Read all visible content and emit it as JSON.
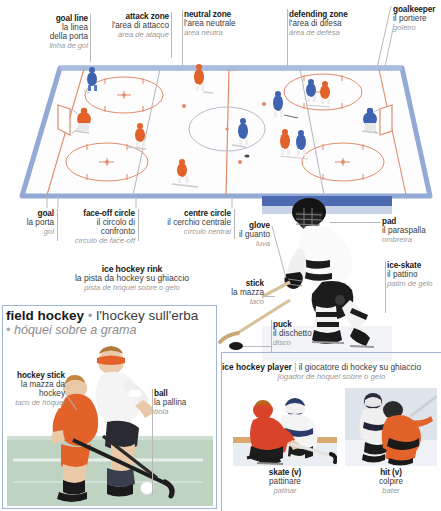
{
  "page": {
    "accent_blue": "#93a9d6",
    "rink_line_color": "#e08a6a",
    "panel_border": "#9fb6d8",
    "label_gray": "#9a9a9a"
  },
  "top_labels": [
    {
      "en": "goal line",
      "it": [
        "la linea",
        "della porta"
      ],
      "pt": "linha de gol",
      "align": "right"
    },
    {
      "en": "attack zone",
      "it": [
        "l'area di attacco"
      ],
      "pt": "área de ataque",
      "align": "right"
    },
    {
      "en": "neutral zone",
      "it": [
        "l'area neutrale"
      ],
      "pt": "área neutra",
      "align": "left"
    },
    {
      "en": "defending zone",
      "it": [
        "l'area di difesa"
      ],
      "pt": "área de defesa",
      "align": "left"
    },
    {
      "en": "goalkeeper",
      "it": [
        "il portiere"
      ],
      "pt": "goleiro",
      "align": "left"
    }
  ],
  "rink_bottom_labels": [
    {
      "en": "goal",
      "it": [
        "la porta"
      ],
      "pt": "gol",
      "align": "right"
    },
    {
      "en": "face-off circle",
      "it": [
        "il circolo di",
        "confronto"
      ],
      "pt": "círculo de face-off",
      "align": "right"
    },
    {
      "en": "centre circle",
      "it": [
        "il cerchio centrale"
      ],
      "pt": "círculo central",
      "align": "right"
    }
  ],
  "rink_caption": {
    "en": "ice hockey rink",
    "it": "la pista da hockey su ghiaccio",
    "pt": "pista de hóquei sobre o gelo"
  },
  "player_labels": [
    {
      "en": "glove",
      "it": [
        "il guanto"
      ],
      "pt": "luva",
      "align": "right"
    },
    {
      "en": "stick",
      "it": [
        "la mazza"
      ],
      "pt": "taco",
      "align": "right"
    },
    {
      "en": "puck",
      "it": [
        "il dischetto"
      ],
      "pt": "disco",
      "align": "left"
    },
    {
      "en": "pad",
      "it": [
        "il paraspalla"
      ],
      "pt": "ombreira",
      "align": "left"
    },
    {
      "en": "ice-skate",
      "it": [
        "il pattino"
      ],
      "pt": "patim de gelo",
      "align": "left"
    }
  ],
  "field_hockey": {
    "heading_en": "field hockey",
    "heading_sep": "•",
    "heading_it": "l'hockey sull'erba",
    "heading_pt": "hóquei sobre a grama",
    "labels": [
      {
        "en": "hockey stick",
        "it": [
          "la mazza da",
          "hockey"
        ],
        "pt": "taco de hóquei",
        "align": "right"
      },
      {
        "en": "ball",
        "it": [
          "la pallina"
        ],
        "pt": "bola",
        "align": "left"
      }
    ]
  },
  "ice_hockey_player": {
    "en": "ice hockey player",
    "separator": "|",
    "it": "il giocatore di hockey su ghiaccio",
    "pt": "jogador de hóquei sobre o gelo"
  },
  "verbs": [
    {
      "en": "skate (v)",
      "it": "pattinare",
      "pt": "patinar"
    },
    {
      "en": "hit (v)",
      "it": "colpire",
      "pt": "bater"
    }
  ]
}
